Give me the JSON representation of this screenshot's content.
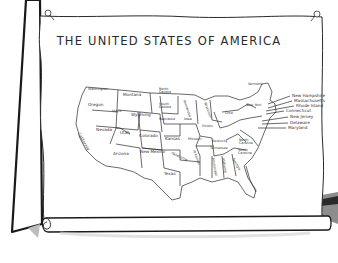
{
  "title": "THE UNITED STATES OF AMERICA",
  "states": {
    "washington": "Washington",
    "oregon": "Oregon",
    "california": "California",
    "idaho": "Idaho",
    "nevada": "Nevada",
    "montana": "Montana",
    "wyoming": "Wyoming",
    "utah": "Utah",
    "arizona": "Arizona",
    "colorado": "Colorado",
    "new_mexico": "New Mexico",
    "north_dakota": "North Dakota",
    "south_dakota": "South Dakota",
    "nebraska": "Nebraska",
    "kansas": "Kansas",
    "oklahoma": "Oklahoma",
    "texas": "Texas",
    "minnesota": "Minnesota",
    "iowa": "Iowa",
    "missouri": "Missouri",
    "arkansas": "Arkansas",
    "louisiana": "Louisiana",
    "wisconsin": "Wisconsin",
    "illinois": "Illinois",
    "michigan": "Michigan",
    "indiana": "Indiana",
    "ohio": "Ohio",
    "kentucky": "Kentucky",
    "tennessee": "Tennessee",
    "mississippi": "Mississippi",
    "alabama": "Alabama",
    "georgia": "Georgia",
    "florida": "Florida",
    "south_carolina": "South Carolina",
    "north_carolina": "North Carolina",
    "virginia": "Virginia",
    "west_virginia": "West Virginia",
    "pennsylvania": "Pennsylvania",
    "new_york": "New York",
    "vermont": "Vermont",
    "maine": "Maine"
  },
  "callouts": [
    "New Hampshire",
    "Massachusetts",
    "Rhode Island",
    "Connecticut",
    "New Jersey",
    "Delaware",
    "Maryland"
  ]
}
